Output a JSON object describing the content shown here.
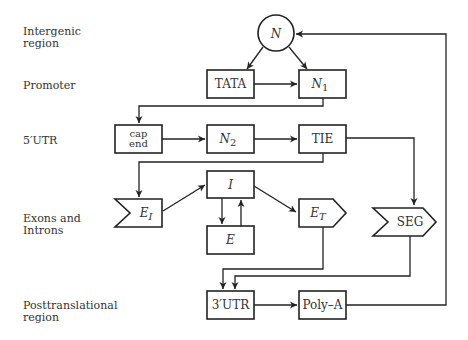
{
  "diagram": {
    "type": "flowchart",
    "title": "",
    "row_labels": [
      {
        "id": "intergenic",
        "lines": [
          "Intergenic",
          "region"
        ]
      },
      {
        "id": "promoter",
        "lines": [
          "Promoter"
        ]
      },
      {
        "id": "utr5",
        "lines": [
          "5′UTR"
        ]
      },
      {
        "id": "exons",
        "lines": [
          "Exons and",
          "Introns"
        ]
      },
      {
        "id": "posttrans",
        "lines": [
          "Posttranslational",
          "region"
        ]
      }
    ],
    "nodes": {
      "N": {
        "label": "N",
        "shape": "circle"
      },
      "TATA": {
        "label": "TATA",
        "shape": "box"
      },
      "N1": {
        "label": "N",
        "sub": "1",
        "shape": "box"
      },
      "capend": {
        "label_top": "cap",
        "label_bottom": "end",
        "shape": "box"
      },
      "N2": {
        "label": "N",
        "sub": "2",
        "shape": "box"
      },
      "TIE": {
        "label": "TIE",
        "shape": "box"
      },
      "EI": {
        "label": "E",
        "sub": "I",
        "shape": "notched-left"
      },
      "I": {
        "label": "I",
        "shape": "box"
      },
      "E": {
        "label": "E",
        "shape": "box"
      },
      "ET": {
        "label": "E",
        "sub": "T",
        "shape": "arrow-right"
      },
      "SEG": {
        "label": "SEG",
        "shape": "chevron"
      },
      "UTR3": {
        "label": "3′UTR",
        "shape": "box"
      },
      "PolyA": {
        "label": "Poly–A",
        "shape": "box"
      }
    },
    "edges": [
      [
        "N",
        "TATA"
      ],
      [
        "N",
        "N1"
      ],
      [
        "TATA",
        "N1"
      ],
      [
        "N1",
        "capend"
      ],
      [
        "capend",
        "N2"
      ],
      [
        "N2",
        "TIE"
      ],
      [
        "TIE",
        "EI"
      ],
      [
        "TIE",
        "SEG"
      ],
      [
        "EI",
        "I"
      ],
      [
        "I",
        "E"
      ],
      [
        "E",
        "I"
      ],
      [
        "I",
        "ET"
      ],
      [
        "ET",
        "UTR3"
      ],
      [
        "SEG",
        "UTR3"
      ],
      [
        "UTR3",
        "PolyA"
      ],
      [
        "PolyA",
        "N"
      ]
    ]
  }
}
